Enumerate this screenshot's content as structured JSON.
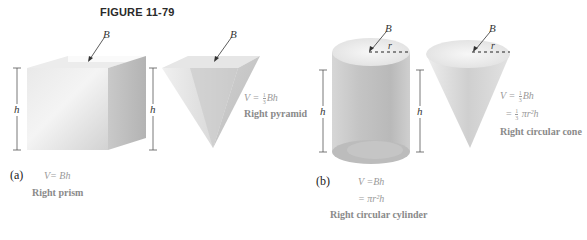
{
  "figure": {
    "title": "FIGURE 11-79"
  },
  "part_a": {
    "label": "(a)",
    "prism": {
      "base_label": "B",
      "height_label": "h",
      "formula": "V= Bh",
      "name": "Right prism"
    },
    "pyramid": {
      "base_label": "B",
      "height_label": "h",
      "formula_lhs": "V =",
      "formula_frac_num": "1",
      "formula_frac_den": "3",
      "formula_rhs": "Bh",
      "name": "Right pyramid"
    }
  },
  "part_b": {
    "label": "(b)",
    "cylinder": {
      "base_label": "B",
      "radius_label": "r",
      "height_label": "h",
      "formula_line1": "V =Bh",
      "formula_line2": "= πr²h",
      "name": "Right circular cylinder"
    },
    "cone": {
      "base_label": "B",
      "radius_label": "r",
      "height_label": "h",
      "formula_lhs": "V =",
      "formula_frac_num": "1",
      "formula_frac_den": "3",
      "formula_rhs": "Bh",
      "formula_line2_lhs": "=",
      "formula_line2_rhs": "πr²h",
      "name": "Right circular cone"
    }
  },
  "colors": {
    "solid_light": "#f2f2f2",
    "solid_mid": "#d8d8d8",
    "solid_dark": "#b8b8b8",
    "text_gray": "#9a9a9a",
    "line": "#555555"
  }
}
